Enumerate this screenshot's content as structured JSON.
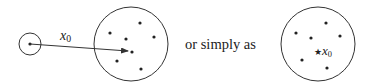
{
  "diagram": {
    "stroke_color": "#333333",
    "left_figure": {
      "small_set": {
        "cx": 30,
        "cy": 44,
        "r": 11,
        "point": {
          "x": 30,
          "y": 44
        }
      },
      "arrow": {
        "from": {
          "x": 30,
          "y": 44
        },
        "to": {
          "x": 128,
          "y": 51
        },
        "label": "x",
        "label_sub": "0"
      },
      "big_set": {
        "cx": 131,
        "cy": 44,
        "r": 37,
        "points": [
          {
            "x": 140,
            "y": 23
          },
          {
            "x": 110,
            "y": 33
          },
          {
            "x": 154,
            "y": 37
          },
          {
            "x": 126,
            "y": 39
          },
          {
            "x": 132,
            "y": 52
          },
          {
            "x": 117,
            "y": 61
          },
          {
            "x": 141,
            "y": 69
          }
        ]
      }
    },
    "connector_text": "or simply as",
    "right_figure": {
      "big_set": {
        "cx": 318,
        "cy": 44,
        "r": 37,
        "points": [
          {
            "x": 326,
            "y": 23
          },
          {
            "x": 296,
            "y": 33
          },
          {
            "x": 340,
            "y": 36
          },
          {
            "x": 311,
            "y": 38
          },
          {
            "x": 302,
            "y": 60
          },
          {
            "x": 327,
            "y": 68
          }
        ],
        "star": {
          "x": 319,
          "y": 50,
          "glyph": "★"
        },
        "star_label": "x",
        "star_label_sub": "0"
      }
    }
  }
}
